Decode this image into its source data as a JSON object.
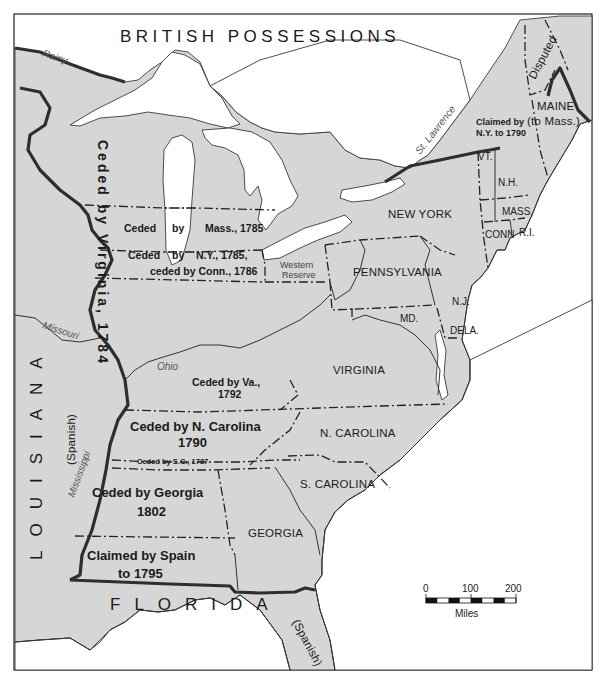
{
  "map": {
    "title": "BRITISH POSSESSIONS",
    "colors": {
      "land": "#d6d6d6",
      "water": "#ffffff",
      "border": "#2e2e2e",
      "text": "#1a1a1a"
    },
    "regions": {
      "louisiana": "LOUISIANA",
      "louisiana_spanish": "(Spanish)",
      "florida": "FLORIDA",
      "florida_spanish": "(Spanish)"
    },
    "states": {
      "maine": "MAINE",
      "maine_note": "(to Mass.)",
      "vt": "VT.",
      "nh": "N.H.",
      "mass": "MASS.",
      "conn": "CONN",
      "ri": "R.I.",
      "new_york": "NEW YORK",
      "pennsylvania": "PENNSYLVANIA",
      "nj": "N.J.",
      "md": "MD.",
      "dela": "DELA.",
      "virginia": "VIRGINIA",
      "n_carolina": "N. CAROLINA",
      "s_carolina": "S. CAROLINA",
      "georgia": "GEORGIA"
    },
    "claims": {
      "disputed": "Disputed",
      "claimed_ny_line1": "Claimed by",
      "claimed_ny_line2": "N.Y. to 1790",
      "western_reserve_line1": "Western",
      "western_reserve_line2": "Reserve"
    },
    "cessions": {
      "virginia_1784": "Ceded by Virginia, 1784",
      "mass_1785_a": "Ceded",
      "mass_1785_b": "by",
      "mass_1785_c": "Mass., 1785",
      "ny_1785_a": "Ceded",
      "ny_1785_b": "by",
      "ny_1785_c": "N.Y., 1785,",
      "conn_1786": "ceded by Conn., 1786",
      "va_1792_line1": "Ceded by Va.,",
      "va_1792_line2": "1792",
      "nc_1790_line1": "Ceded by N. Carolina",
      "nc_1790_line2": "1790",
      "sc_1787": "Ceded by S.C., 1787",
      "ga_1802_line1": "Ceded by Georgia",
      "ga_1802_line2": "1802",
      "spain_1795_line1": "Claimed by Spain",
      "spain_1795_line2": "to 1795"
    },
    "rivers": {
      "rainy": "Rainy",
      "st_lawrence": "St. Lawrence",
      "missouri": "Missouri",
      "ohio": "Ohio",
      "mississippi": "Mississippi"
    },
    "scale": {
      "ticks": [
        "0",
        "100",
        "200"
      ],
      "unit": "Miles"
    }
  }
}
